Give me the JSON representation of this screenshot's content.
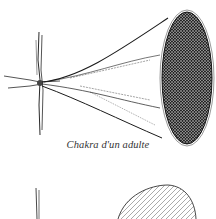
{
  "figure": {
    "caption": "Chakra d'un adulte",
    "illustrations": [
      {
        "name": "adult-chakra-funnel",
        "description": "cross-shaped root with wide funnel opening into dark hatched ellipse"
      },
      {
        "name": "second-chakra-partial",
        "description": "partially visible vertical line and lightly hatched dome shape"
      }
    ],
    "colors": {
      "ink": "#1a1a1a",
      "paper": "#ffffff"
    }
  }
}
